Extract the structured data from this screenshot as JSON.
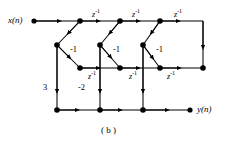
{
  "figure": {
    "caption": "( b )",
    "input_label": "x(n)",
    "output_label": "y(n)",
    "ink_color": "#000000",
    "background_color": "#ffffff",
    "delay_label_base": "z",
    "delay_label_exponent": "-1",
    "delay_labels_top": [
      "z",
      "z",
      "z"
    ],
    "delay_labels_middle": [
      "z",
      "z",
      "z"
    ],
    "gain_feedback": [
      "-1",
      "-1",
      "-1"
    ],
    "gain_forward_first": "3",
    "gain_forward_second": "-2",
    "exponent": "-1"
  },
  "diagram_data": {
    "type": "signal-flow-graph",
    "description": "IIR lattice-ladder digital filter structure",
    "rows": {
      "top_y": 21,
      "upper_mid_y": 45,
      "lower_mid_y": 68,
      "bottom_y": 110
    },
    "nodes": [
      {
        "id": "in-terminal",
        "x": 34,
        "y": 21,
        "type": "terminal"
      },
      {
        "id": "top-1",
        "x": 80,
        "y": 21,
        "type": "junction"
      },
      {
        "id": "top-2",
        "x": 120,
        "y": 21,
        "type": "junction"
      },
      {
        "id": "top-3",
        "x": 160,
        "y": 21,
        "type": "junction"
      },
      {
        "id": "upper-mid-1",
        "x": 57,
        "y": 45,
        "type": "junction"
      },
      {
        "id": "upper-mid-2",
        "x": 100,
        "y": 45,
        "type": "junction"
      },
      {
        "id": "upper-mid-3",
        "x": 143,
        "y": 45,
        "type": "junction"
      },
      {
        "id": "lower-mid-1",
        "x": 80,
        "y": 68,
        "type": "junction"
      },
      {
        "id": "lower-mid-2",
        "x": 120,
        "y": 68,
        "type": "junction"
      },
      {
        "id": "lower-mid-3",
        "x": 160,
        "y": 68,
        "type": "junction"
      },
      {
        "id": "lower-mid-4",
        "x": 203,
        "y": 68,
        "type": "junction"
      },
      {
        "id": "bottom-1",
        "x": 57,
        "y": 110,
        "type": "junction"
      },
      {
        "id": "bottom-2",
        "x": 100,
        "y": 110,
        "type": "junction"
      },
      {
        "id": "bottom-3",
        "x": 143,
        "y": 110,
        "type": "junction"
      },
      {
        "id": "out-terminal",
        "x": 190,
        "y": 110,
        "type": "terminal"
      }
    ]
  }
}
